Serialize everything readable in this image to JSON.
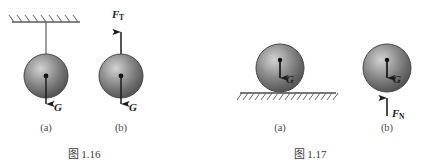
{
  "page": {
    "background_color": "#ffffff",
    "width": 428,
    "height": 166
  },
  "figures": [
    {
      "id": "fig-1-16",
      "caption": "图 1.16",
      "caption_x": 85,
      "caption_y": 157,
      "panels": [
        {
          "id": "fig-1-16-a",
          "sublabel": "(a)",
          "sublabel_x": 46,
          "sublabel_y": 131,
          "description": "ball hanging from hatched ceiling by a string, weight G acting downward",
          "sphere": {
            "cx": 46,
            "cy": 76,
            "r": 22
          },
          "support": {
            "type": "ceiling-hatched",
            "line_x1": 12,
            "line_x2": 80,
            "line_y": 22,
            "hatch_count": 8,
            "hatch_len": 8,
            "hatch_dx": 6
          },
          "string": {
            "x": 46,
            "y1": 22,
            "y2": 76
          },
          "forces": [
            {
              "name": "G",
              "label": "G",
              "subscript": "",
              "direction": "down",
              "x": 46,
              "tail_y": 76,
              "head_y": 112,
              "label_x": 54,
              "label_y": 110
            }
          ]
        },
        {
          "id": "fig-1-16-b",
          "sublabel": "(b)",
          "sublabel_x": 121,
          "sublabel_y": 131,
          "description": "isolated ball free-body diagram with tension F_T upward and weight G downward",
          "sphere": {
            "cx": 121,
            "cy": 76,
            "r": 22
          },
          "forces": [
            {
              "name": "F_T",
              "label": "F",
              "subscript": "T",
              "direction": "up",
              "x": 121,
              "tail_y": 76,
              "head_y": 24,
              "label_x": 114,
              "label_y": 17
            },
            {
              "name": "G",
              "label": "G",
              "subscript": "",
              "direction": "down",
              "x": 121,
              "tail_y": 76,
              "head_y": 112,
              "label_x": 129,
              "label_y": 110
            }
          ]
        }
      ]
    },
    {
      "id": "fig-1-17",
      "caption": "图 1.17",
      "caption_x": 310,
      "caption_y": 157,
      "panels": [
        {
          "id": "fig-1-17-a",
          "sublabel": "(a)",
          "sublabel_x": 280,
          "sublabel_y": 131,
          "description": "ball resting on hatched ground surface, weight G acting downward from centre",
          "sphere": {
            "cx": 280,
            "cy": 68,
            "r": 24
          },
          "support": {
            "type": "ground-hatched",
            "line_x1": 240,
            "line_x2": 336,
            "line_y": 93,
            "hatch_count": 16,
            "hatch_len": 7,
            "hatch_dx": 5
          },
          "forces": [
            {
              "name": "G",
              "label": "G",
              "subscript": "",
              "direction": "down",
              "x": 280,
              "tail_y": 62,
              "head_y": 86,
              "label_x": 287,
              "label_y": 85
            }
          ]
        },
        {
          "id": "fig-1-17-b",
          "sublabel": "(b)",
          "sublabel_x": 387,
          "sublabel_y": 131,
          "description": "isolated ball free-body diagram with weight G downward and normal force F_N upward",
          "sphere": {
            "cx": 387,
            "cy": 68,
            "r": 24
          },
          "forces": [
            {
              "name": "G",
              "label": "G",
              "subscript": "",
              "direction": "down",
              "x": 387,
              "tail_y": 62,
              "head_y": 86,
              "label_x": 394,
              "label_y": 85
            },
            {
              "name": "F_N",
              "label": "F",
              "subscript": "N",
              "direction": "up",
              "x": 387,
              "tail_y": 116,
              "head_y": 90,
              "label_x": 393,
              "label_y": 115
            }
          ]
        }
      ]
    }
  ],
  "style": {
    "sphere_edge_color": "#4a4a4a",
    "sphere_dark_color": "#585858",
    "sphere_light_color": "#c8c8c8",
    "arrow_color": "#1c1c1c",
    "line_color": "#6b6b6b",
    "hatch_color": "#5a5a5a",
    "text_color": "#3a3a3a"
  }
}
